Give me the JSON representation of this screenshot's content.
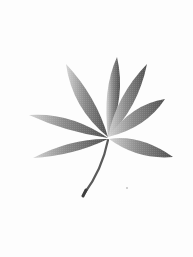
{
  "image": {
    "subject": "palmate leaf (seven leaflets) with curved petiole",
    "background_color": "#fdfdfd",
    "leaf_dark": "#5a5a5a",
    "leaf_light": "#c8c8c8",
    "stem_color": "#555555"
  }
}
